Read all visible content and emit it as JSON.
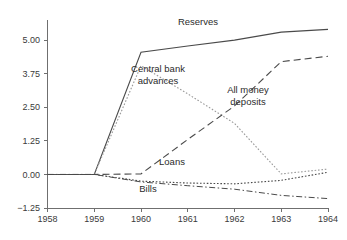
{
  "chart_data": {
    "type": "line",
    "title": "",
    "subtitle": "",
    "xlabel": "",
    "ylabel": "",
    "x": [
      1958,
      1959,
      1960,
      1961,
      1962,
      1963,
      1964
    ],
    "xtick_labels": [
      "1958",
      "1959",
      "1960",
      "1961",
      "1962",
      "1963",
      "1964"
    ],
    "ytick_labels": [
      "5.00",
      "3.75",
      "2.50",
      "1.25",
      "0.00",
      "-1.25"
    ],
    "yticks": [
      5.0,
      3.75,
      2.5,
      1.25,
      0.0,
      -1.25
    ],
    "xlim": [
      1958,
      1964
    ],
    "ylim": [
      -1.25,
      5.75
    ],
    "grid": false,
    "legend_position": "inline-annotations",
    "series": [
      {
        "name": "Reserves",
        "style": "solid",
        "color": "#4a4a4a",
        "values": [
          0.0,
          0.0,
          4.55,
          4.78,
          5.0,
          5.3,
          5.4
        ]
      },
      {
        "name": "Central bank advances",
        "style": "dotted",
        "color": "#9a9a9a",
        "values": [
          0.0,
          0.0,
          4.05,
          3.0,
          1.9,
          0.02,
          0.2
        ]
      },
      {
        "name": "All money deposits",
        "style": "dashed",
        "color": "#4a4a4a",
        "values": [
          0.0,
          0.0,
          0.02,
          1.3,
          2.55,
          4.2,
          4.4
        ]
      },
      {
        "name": "Loans",
        "style": "dotted",
        "color": "#4a4a4a",
        "values": [
          0.0,
          0.0,
          -0.25,
          -0.32,
          -0.35,
          -0.22,
          0.08
        ]
      },
      {
        "name": "Bills",
        "style": "dash-dot",
        "color": "#4a4a4a",
        "values": [
          0.0,
          0.0,
          -0.28,
          -0.42,
          -0.55,
          -0.78,
          -0.9
        ]
      }
    ],
    "annotations": [
      {
        "text": "Reserves",
        "x_px": 198,
        "y_px": 25
      },
      {
        "text": "Central bank",
        "x_px": 158,
        "y_px": 72
      },
      {
        "text": "advances",
        "x_px": 158,
        "y_px": 84
      },
      {
        "text": "All money",
        "x_px": 248,
        "y_px": 93
      },
      {
        "text": "deposits",
        "x_px": 248,
        "y_px": 105
      },
      {
        "text": "Loans",
        "x_px": 172,
        "y_px": 165
      },
      {
        "text": "Bills",
        "x_px": 148,
        "y_px": 192
      }
    ]
  },
  "axis": {
    "y_label_x": 40,
    "x_label_y": 222
  }
}
